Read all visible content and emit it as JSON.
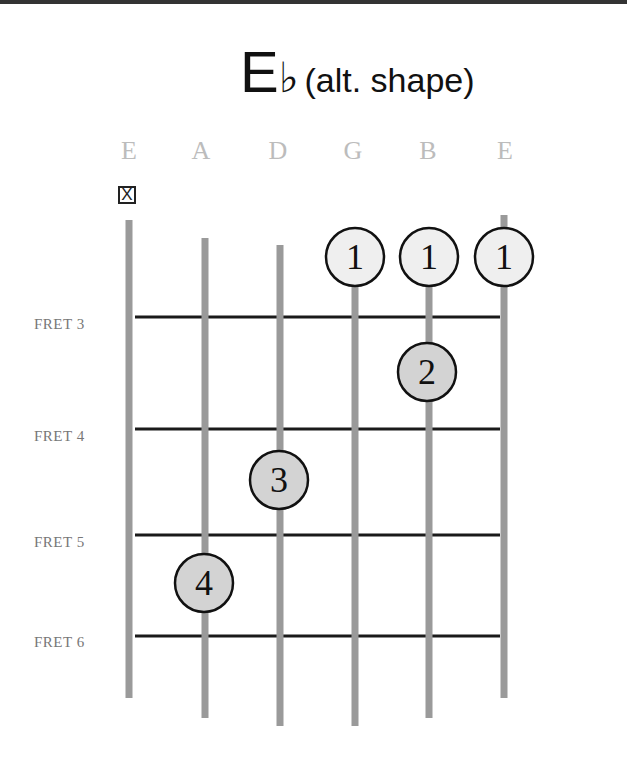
{
  "title": {
    "chord": "E",
    "accidental": "♭",
    "subtitle": "(alt. shape)"
  },
  "strings": [
    {
      "name": "E",
      "x": 129,
      "top": 220,
      "bottom": 698
    },
    {
      "name": "A",
      "x": 205,
      "top": 238,
      "bottom": 718
    },
    {
      "name": "D",
      "x": 280,
      "top": 245,
      "bottom": 726
    },
    {
      "name": "G",
      "x": 355,
      "top": 245,
      "bottom": 726
    },
    {
      "name": "B",
      "x": 429,
      "top": 245,
      "bottom": 718
    },
    {
      "name": "E",
      "x": 504,
      "top": 215,
      "bottom": 698
    }
  ],
  "muted_string": {
    "index": 0,
    "symbol": "X"
  },
  "frets": [
    {
      "label": "FRET 3",
      "y": 317
    },
    {
      "label": "FRET 4",
      "y": 429
    },
    {
      "label": "FRET 5",
      "y": 535
    },
    {
      "label": "FRET 6",
      "y": 636
    }
  ],
  "fingers": [
    {
      "finger": "1",
      "string": 3,
      "cx": 355,
      "cy": 257,
      "fill": "#efefef"
    },
    {
      "finger": "1",
      "string": 4,
      "cx": 429,
      "cy": 257,
      "fill": "#efefef"
    },
    {
      "finger": "1",
      "string": 5,
      "cx": 504,
      "cy": 257,
      "fill": "#efefef"
    },
    {
      "finger": "2",
      "string": 4,
      "cx": 427,
      "cy": 372,
      "fill": "#d3d3d3"
    },
    {
      "finger": "3",
      "string": 2,
      "cx": 279,
      "cy": 480,
      "fill": "#d3d3d3"
    },
    {
      "finger": "4",
      "string": 1,
      "cx": 204,
      "cy": 583,
      "fill": "#d3d3d3"
    }
  ],
  "colors": {
    "string": "#9a9a9a",
    "fret": "#1a1a1a",
    "label": "#777777",
    "string_name": "#bcbcbc"
  }
}
